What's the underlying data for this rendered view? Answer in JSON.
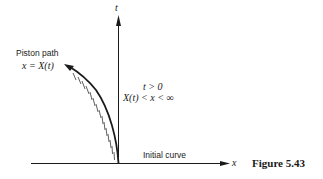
{
  "figure": {
    "caption": "Figure 5.43",
    "axes": {
      "vertical_label": "t",
      "horizontal_label": "x"
    },
    "piston": {
      "title": "Piston path",
      "equation": "x = X(t)"
    },
    "region": {
      "condition_time": "t > 0",
      "condition_space": "X(t) < x < ∞"
    },
    "initial_curve_label": "Initial curve",
    "colors": {
      "ink": "#1a1a1a",
      "background": "#ffffff"
    }
  }
}
